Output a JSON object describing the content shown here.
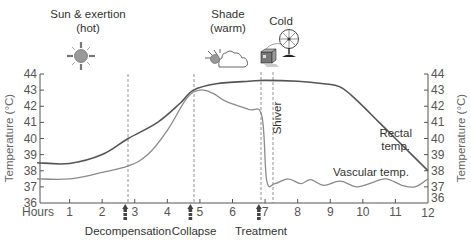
{
  "chart_data": {
    "type": "line",
    "title": "",
    "xlabel": "Hours",
    "ylabel": "Temperature (°C)",
    "ylabel_right": "Temperature (°C)",
    "xlim": [
      0,
      12
    ],
    "ylim": [
      36,
      44
    ],
    "x_ticks": [
      1,
      2,
      3,
      4,
      5,
      6,
      7,
      8,
      9,
      10,
      11,
      12
    ],
    "y_ticks": [
      36,
      37,
      38,
      39,
      40,
      41,
      42,
      43,
      44
    ],
    "grid": false,
    "series": [
      {
        "name": "Rectal temp.",
        "color": "#555555",
        "x": [
          0,
          1,
          2,
          2.8,
          3.7,
          4.4,
          4.8,
          5.5,
          6.5,
          7,
          8,
          8.8,
          9.3,
          9.8,
          10.5,
          11,
          11.5,
          12
        ],
        "y": [
          38.5,
          38.45,
          39.0,
          40.0,
          41.0,
          42.2,
          43.0,
          43.4,
          43.55,
          43.6,
          43.55,
          43.4,
          43.2,
          42.4,
          41.0,
          40.0,
          39.0,
          38.0
        ]
      },
      {
        "name": "Vascular temp.",
        "color": "#8a8a8a",
        "x": [
          0,
          1,
          2,
          2.8,
          3.4,
          4.0,
          4.6,
          5.0,
          5.4,
          5.8,
          6.5,
          6.9,
          7.05,
          7.3,
          7.7,
          8.1,
          8.4,
          8.8,
          9.3,
          9.8,
          10.2,
          10.7,
          11.2,
          11.6,
          12
        ],
        "y": [
          37.5,
          37.5,
          37.9,
          38.3,
          39.0,
          40.5,
          42.5,
          43.0,
          42.8,
          42.3,
          41.8,
          41.4,
          37.4,
          37.2,
          37.5,
          37.2,
          37.45,
          37.1,
          37.35,
          37.0,
          37.2,
          37.5,
          37.1,
          37.0,
          37.5
        ]
      }
    ],
    "phases": [
      {
        "label": "Sun & exertion",
        "sublabel": "(hot)",
        "icon": "sun-icon"
      },
      {
        "label": "Shade",
        "sublabel": "(warm)",
        "icon": "sun-behind-cloud-icon"
      },
      {
        "label": "Cold",
        "sublabel": "",
        "icon": "ice-box-and-fan-icon"
      }
    ],
    "events": [
      {
        "label": "Decompensation",
        "hour": 2.8
      },
      {
        "label": "Collapse",
        "hour": 4.8
      },
      {
        "label": "Treatment",
        "hour": 6.9
      },
      {
        "label": "Shiver",
        "hour": 7.25
      }
    ],
    "annotations": [
      "Rectal temp.",
      "Vascular temp.",
      "Shiver"
    ]
  },
  "labels": {
    "sun_title": "Sun & exertion",
    "sun_sub": "(hot)",
    "shade_title": "Shade",
    "shade_sub": "(warm)",
    "cold_title": "Cold",
    "hours": "Hours",
    "y_title_left": "Temperature (°C)",
    "y_title_right": "Temperature (°C)",
    "rectal_1": "Rectal",
    "rectal_2": "temp.",
    "vascular": "Vascular temp.",
    "shiver": "Shiver",
    "decompensation": "Decompensation",
    "collapse": "Collapse",
    "treatment": "Treatment"
  }
}
